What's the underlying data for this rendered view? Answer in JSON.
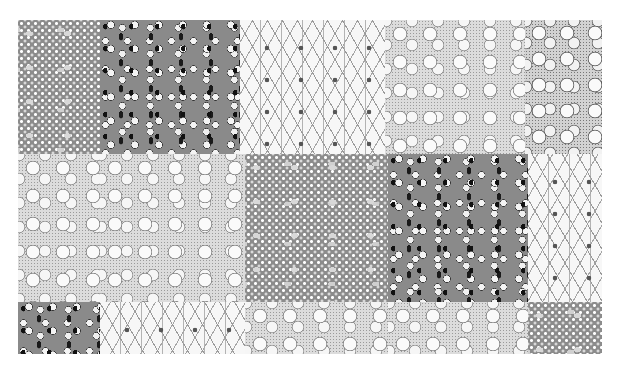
{
  "scene": {
    "description": "Grayscale photograph of a patchwork quilt made of square fabric patches in five print patterns",
    "background_color": "#ffffff",
    "quilt_bounds": {
      "x": 18,
      "y": 20,
      "width": 584,
      "height": 334
    }
  },
  "patterns": {
    "dots": {
      "label": "gray fabric with white star dots and pale leaves",
      "base_color": "#8c8c8c"
    },
    "tulip": {
      "label": "gray fabric with white tulips and black leaves",
      "base_color": "#8a8a8a"
    },
    "lattice": {
      "label": "white fabric with gray lattice and small flowers",
      "base_color": "#f7f7f7"
    },
    "floral": {
      "label": "light stippled fabric with white outlined flowers",
      "base_color": "#dcdcdc"
    },
    "floral-dense": {
      "label": "denser stippled fabric with white outlined flowers",
      "base_color": "#d2d2d2"
    }
  },
  "patches": [
    {
      "row": 1,
      "col": 1,
      "pattern": "dots",
      "x": 18,
      "y": 20,
      "w": 82,
      "h": 134
    },
    {
      "row": 1,
      "col": 2,
      "pattern": "tulip",
      "x": 100,
      "y": 20,
      "w": 140,
      "h": 134
    },
    {
      "row": 1,
      "col": 3,
      "pattern": "lattice",
      "x": 240,
      "y": 20,
      "w": 145,
      "h": 134
    },
    {
      "row": 1,
      "col": 4,
      "pattern": "floral",
      "x": 385,
      "y": 20,
      "w": 140,
      "h": 134
    },
    {
      "row": 1,
      "col": 5,
      "pattern": "floral-dense",
      "x": 525,
      "y": 20,
      "w": 77,
      "h": 134
    },
    {
      "row": 2,
      "col": 1,
      "pattern": "floral",
      "x": 18,
      "y": 154,
      "w": 82,
      "h": 148
    },
    {
      "row": 2,
      "col": 2,
      "pattern": "floral",
      "x": 100,
      "y": 154,
      "w": 145,
      "h": 148
    },
    {
      "row": 2,
      "col": 3,
      "pattern": "dots",
      "x": 245,
      "y": 154,
      "w": 143,
      "h": 148
    },
    {
      "row": 2,
      "col": 4,
      "pattern": "tulip",
      "x": 388,
      "y": 154,
      "w": 140,
      "h": 148
    },
    {
      "row": 2,
      "col": 5,
      "pattern": "lattice",
      "x": 528,
      "y": 154,
      "w": 74,
      "h": 148
    },
    {
      "row": 3,
      "col": 1,
      "pattern": "tulip",
      "x": 18,
      "y": 302,
      "w": 82,
      "h": 52
    },
    {
      "row": 3,
      "col": 2,
      "pattern": "lattice",
      "x": 100,
      "y": 302,
      "w": 145,
      "h": 52
    },
    {
      "row": 3,
      "col": 3,
      "pattern": "floral",
      "x": 245,
      "y": 302,
      "w": 143,
      "h": 52
    },
    {
      "row": 3,
      "col": 4,
      "pattern": "floral",
      "x": 388,
      "y": 302,
      "w": 140,
      "h": 52
    },
    {
      "row": 3,
      "col": 5,
      "pattern": "dots",
      "x": 528,
      "y": 302,
      "w": 74,
      "h": 52
    }
  ]
}
